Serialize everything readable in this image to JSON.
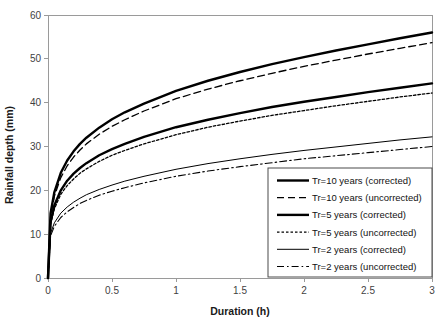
{
  "chart_data": {
    "type": "line",
    "title": "",
    "xlabel": "Duration (h)",
    "ylabel": "Rainfall depth (mm)",
    "xlim": [
      0,
      3
    ],
    "ylim": [
      0,
      60
    ],
    "xticks": [
      "0",
      "0.5",
      "1",
      "1.5",
      "2",
      "2.5",
      "3"
    ],
    "xtick_values": [
      0,
      0.5,
      1,
      1.5,
      2,
      2.5,
      3
    ],
    "yticks": [
      "0",
      "10",
      "20",
      "30",
      "40",
      "50",
      "60"
    ],
    "ytick_values": [
      0,
      10,
      20,
      30,
      40,
      50,
      60
    ],
    "grid": false,
    "legend_position": "bottom-right",
    "x": [
      0,
      0.02,
      0.05,
      0.1,
      0.15,
      0.2,
      0.25,
      0.3,
      0.4,
      0.5,
      0.6,
      0.75,
      1.0,
      1.25,
      1.5,
      1.75,
      2.0,
      2.25,
      2.5,
      2.75,
      3.0
    ],
    "series": [
      {
        "name": "Tr=10 years (corrected)",
        "style": "solid-thick",
        "values": [
          0,
          14.8,
          19.6,
          24.0,
          26.8,
          28.9,
          30.6,
          32.0,
          34.3,
          36.2,
          37.8,
          39.8,
          42.7,
          45.0,
          47.0,
          48.8,
          50.4,
          51.9,
          53.3,
          54.7,
          56.0
        ]
      },
      {
        "name": "Tr=10 years (uncorrected)",
        "style": "dashed",
        "values": [
          0,
          14.0,
          18.7,
          22.9,
          25.6,
          27.6,
          29.2,
          30.6,
          32.8,
          34.6,
          36.1,
          38.1,
          40.9,
          43.1,
          45.0,
          46.7,
          48.3,
          49.7,
          51.1,
          52.4,
          53.7
        ]
      },
      {
        "name": "Tr=5 years (corrected)",
        "style": "solid-thick",
        "values": [
          0,
          12.8,
          16.6,
          20.0,
          22.2,
          23.8,
          25.1,
          26.2,
          28.0,
          29.4,
          30.6,
          32.2,
          34.4,
          36.1,
          37.6,
          39.0,
          40.2,
          41.3,
          42.4,
          43.4,
          44.4
        ]
      },
      {
        "name": "Tr=5 years (uncorrected)",
        "style": "dotted",
        "values": [
          0,
          12.2,
          15.8,
          19.1,
          21.1,
          22.6,
          23.9,
          24.9,
          26.6,
          28.0,
          29.1,
          30.6,
          32.7,
          34.4,
          35.8,
          37.1,
          38.2,
          39.3,
          40.3,
          41.3,
          42.2
        ]
      },
      {
        "name": "Tr=2 years (corrected)",
        "style": "solid-thin",
        "values": [
          0,
          10.2,
          12.6,
          14.8,
          16.2,
          17.3,
          18.2,
          19.0,
          20.2,
          21.2,
          22.1,
          23.2,
          24.8,
          26.1,
          27.2,
          28.2,
          29.1,
          29.9,
          30.7,
          31.5,
          32.2
        ]
      },
      {
        "name": "Tr=2 years (uncorrected)",
        "style": "dashdot",
        "values": [
          0,
          9.6,
          11.8,
          13.8,
          15.1,
          16.1,
          17.0,
          17.7,
          18.9,
          19.8,
          20.6,
          21.7,
          23.2,
          24.4,
          25.4,
          26.3,
          27.2,
          27.9,
          28.6,
          29.3,
          30.0
        ]
      }
    ]
  },
  "legend": {
    "items": [
      {
        "label": "Tr=10 years (corrected)",
        "style": "solid-thick"
      },
      {
        "label": "Tr=10 years (uncorrected)",
        "style": "dashed"
      },
      {
        "label": "Tr=5 years (corrected)",
        "style": "solid-thick"
      },
      {
        "label": "Tr=5 years (uncorrected)",
        "style": "dotted"
      },
      {
        "label": "Tr=2 years (corrected)",
        "style": "solid-thin"
      },
      {
        "label": "Tr=2 years (uncorrected)",
        "style": "dashdot"
      }
    ]
  },
  "colors": {
    "line": "#000000",
    "axis": "#9a9a9a",
    "tick_text": "#3f3f3f",
    "title_text": "#1a1a1a",
    "legend_border": "#4a4a4a",
    "background": "#ffffff"
  }
}
